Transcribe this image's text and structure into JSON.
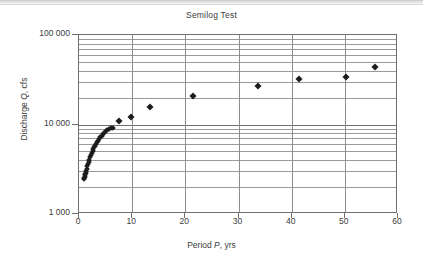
{
  "chart_data": {
    "type": "scatter",
    "title": "Semilog Test",
    "xlabel": "Period P, yrs",
    "ylabel": "Discharge Q, cfs",
    "xlabel_parts": {
      "pre": "Period ",
      "italic": "P",
      "post": ", yrs"
    },
    "ylabel_parts": {
      "pre": "Discharge ",
      "italic": "Q",
      "post": ", cfs"
    },
    "xscale": "linear",
    "yscale": "log",
    "xlim": [
      0,
      60
    ],
    "ylim": [
      1000,
      100000
    ],
    "xticks": [
      0,
      10,
      20,
      30,
      40,
      50,
      60
    ],
    "xticklabels": [
      "0",
      "10",
      "20",
      "30",
      "40",
      "50",
      "60"
    ],
    "yticks": [
      1000,
      10000,
      100000
    ],
    "yticklabels": [
      "1 000",
      "10 000",
      "100 000"
    ],
    "grid": "horizontal-log-minor-and-vertical-major",
    "legend": null,
    "marker": "filled-diamond",
    "marker_color": "#1c1c1c",
    "points": [
      {
        "x": 0.95,
        "y": 2450
      },
      {
        "x": 1.0,
        "y": 2520
      },
      {
        "x": 1.05,
        "y": 2600
      },
      {
        "x": 1.1,
        "y": 2700
      },
      {
        "x": 1.18,
        "y": 2800
      },
      {
        "x": 1.25,
        "y": 2900
      },
      {
        "x": 1.35,
        "y": 3050
      },
      {
        "x": 1.45,
        "y": 3200
      },
      {
        "x": 1.55,
        "y": 3400
      },
      {
        "x": 1.65,
        "y": 3600
      },
      {
        "x": 1.8,
        "y": 3850
      },
      {
        "x": 1.95,
        "y": 4050
      },
      {
        "x": 2.1,
        "y": 4300
      },
      {
        "x": 2.25,
        "y": 4550
      },
      {
        "x": 2.4,
        "y": 4800
      },
      {
        "x": 2.55,
        "y": 5000
      },
      {
        "x": 2.7,
        "y": 5300
      },
      {
        "x": 2.85,
        "y": 5550
      },
      {
        "x": 3.0,
        "y": 5800
      },
      {
        "x": 3.2,
        "y": 6050
      },
      {
        "x": 3.4,
        "y": 6350
      },
      {
        "x": 3.6,
        "y": 6600
      },
      {
        "x": 3.8,
        "y": 6900
      },
      {
        "x": 4.0,
        "y": 7200
      },
      {
        "x": 4.25,
        "y": 7500
      },
      {
        "x": 4.5,
        "y": 7800
      },
      {
        "x": 4.75,
        "y": 8100
      },
      {
        "x": 5.0,
        "y": 8400
      },
      {
        "x": 5.3,
        "y": 8700
      },
      {
        "x": 5.6,
        "y": 8950
      },
      {
        "x": 6.0,
        "y": 9100
      },
      {
        "x": 6.4,
        "y": 9250
      },
      {
        "x": 7.6,
        "y": 11000
      },
      {
        "x": 9.7,
        "y": 12200
      },
      {
        "x": 13.4,
        "y": 15700
      },
      {
        "x": 21.5,
        "y": 21000
      },
      {
        "x": 33.6,
        "y": 27000
      },
      {
        "x": 41.3,
        "y": 32500
      },
      {
        "x": 50.2,
        "y": 34000
      },
      {
        "x": 55.6,
        "y": 44000
      }
    ]
  }
}
